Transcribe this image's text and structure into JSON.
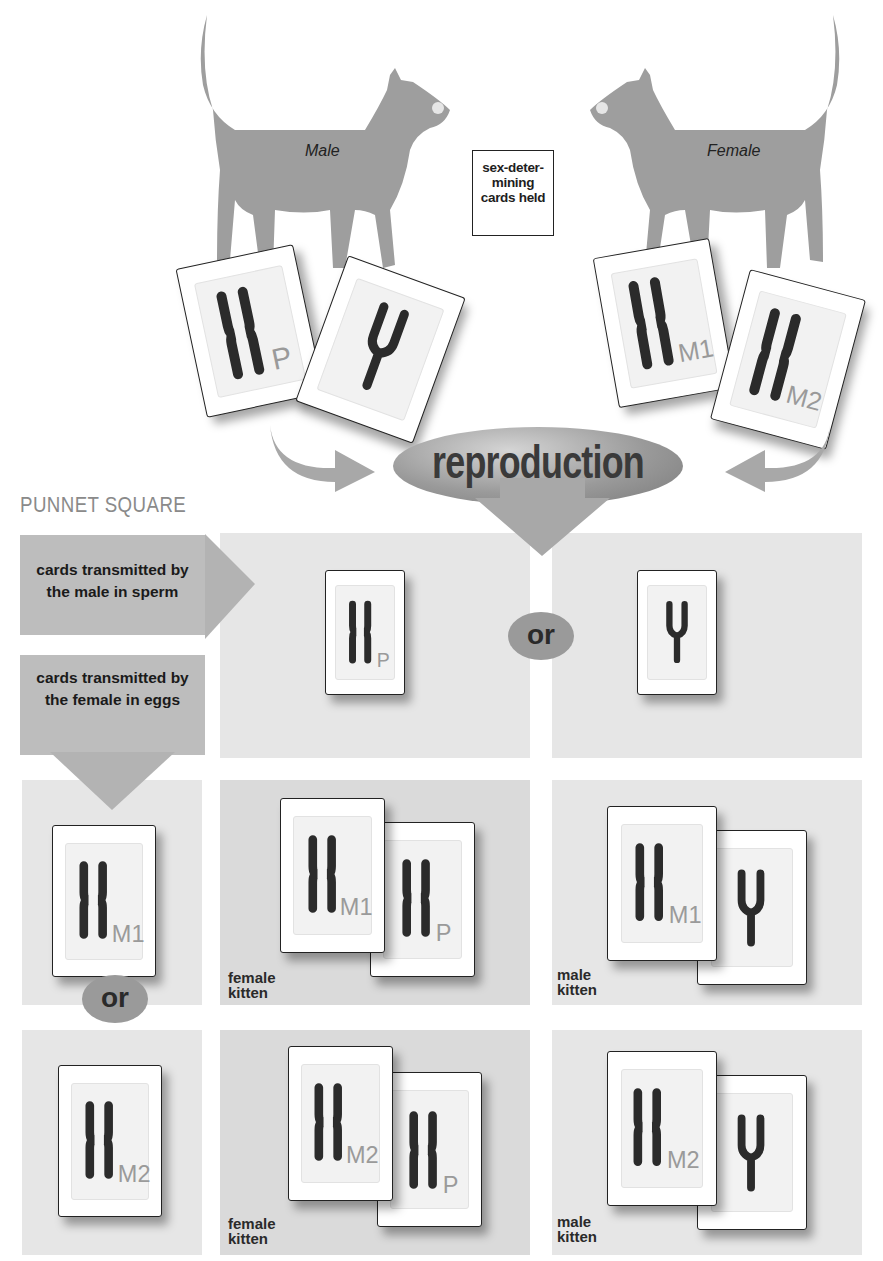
{
  "parents": {
    "male": {
      "label": "Male",
      "cards": [
        {
          "chromosome": "X",
          "subscript": "P"
        },
        {
          "chromosome": "Y",
          "subscript": ""
        }
      ]
    },
    "female": {
      "label": "Female",
      "cards": [
        {
          "chromosome": "X",
          "subscript": "M1"
        },
        {
          "chromosome": "X",
          "subscript": "M2"
        }
      ]
    }
  },
  "legend": {
    "line1": "sex-deter-",
    "line2": "mining",
    "line3": "cards held"
  },
  "process": {
    "label": "reproduction"
  },
  "punnett": {
    "title": "PUNNET SQUARE",
    "male_header": {
      "line1": "cards transmitted by",
      "line2": "the male in sperm"
    },
    "female_header": {
      "line1": "cards transmitted by",
      "line2": "the female in eggs"
    },
    "or_label": "or",
    "columns": [
      {
        "chromosome": "X",
        "subscript": "P"
      },
      {
        "chromosome": "Y",
        "subscript": ""
      }
    ],
    "rows": [
      {
        "chromosome": "X",
        "subscript": "M1"
      },
      {
        "chromosome": "X",
        "subscript": "M2"
      }
    ],
    "cells": [
      {
        "row": 0,
        "col": 0,
        "cards": [
          "X M1",
          "X P"
        ],
        "label_line1": "female",
        "label_line2": "kitten"
      },
      {
        "row": 0,
        "col": 1,
        "cards": [
          "X M1",
          "Y"
        ],
        "label_line1": "male",
        "label_line2": "kitten"
      },
      {
        "row": 1,
        "col": 0,
        "cards": [
          "X M2",
          "X P"
        ],
        "label_line1": "female",
        "label_line2": "kitten"
      },
      {
        "row": 1,
        "col": 1,
        "cards": [
          "X M2",
          "Y"
        ],
        "label_line1": "male",
        "label_line2": "kitten"
      }
    ]
  },
  "colors": {
    "chromosome": "#2b2b2b",
    "subscript": "#9a9a9a",
    "cat": "#9e9e9e",
    "cell": "#e4e4e4",
    "arrow": "#a8a8a8"
  }
}
